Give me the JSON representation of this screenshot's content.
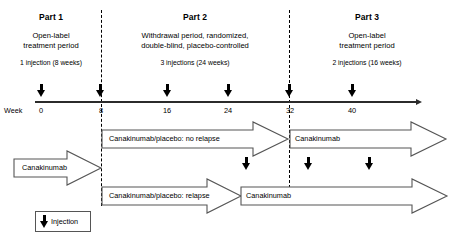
{
  "figure": {
    "type": "clinical-trial-study-design",
    "week_axis_label": "Week"
  },
  "parts": [
    {
      "title": "Part 1",
      "description_line1": "Open-label",
      "description_line2": "treatment period",
      "injections": "1 injection (8 weeks)"
    },
    {
      "title": "Part 2",
      "description_line1": "Withdrawal period, randomized,",
      "description_line2": "double-blind, placebo-controlled",
      "injections": "3 injections (24 weeks)"
    },
    {
      "title": "Part 3",
      "description_line1": "Open-label",
      "description_line2": "treatment period",
      "injections": "2 injections (16 weeks)"
    }
  ],
  "timeline": {
    "ticks": [
      {
        "label": "0",
        "week": 0
      },
      {
        "label": "8",
        "week": 8
      },
      {
        "label": "16",
        "week": 16
      },
      {
        "label": "24",
        "week": 24
      },
      {
        "label": "32",
        "week": 32
      },
      {
        "label": "40",
        "week": 40
      }
    ],
    "axis_injection_weeks": [
      0,
      8,
      16,
      24,
      32,
      40
    ]
  },
  "arms": {
    "part1": {
      "label": "Canakinumab"
    },
    "no_relapse": {
      "label": "Canakinumab/placebo: no relapse"
    },
    "no_relapse_part3": {
      "label": "Canakinumab"
    },
    "relapse": {
      "label": "Canakinumab/placebo: relapse"
    },
    "relapse_rescue": {
      "label": "Canakinumab"
    }
  },
  "mid_band_injections": [
    {
      "id": "mid-injection-1"
    },
    {
      "id": "mid-injection-2"
    },
    {
      "id": "mid-injection-3"
    }
  ],
  "legend": {
    "label": "Injection",
    "icon": "down-arrow-icon"
  },
  "colors": {
    "line": "#2b2b2b",
    "arrow_stroke": "#555555",
    "text": "#000000",
    "background": "#ffffff"
  }
}
